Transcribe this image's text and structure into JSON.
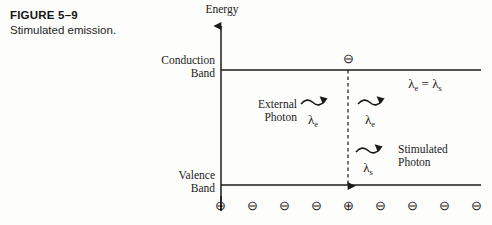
{
  "figure": {
    "number": "FIGURE 5–9",
    "title": "Stimulated emission."
  },
  "diagram": {
    "axis": {
      "energy_label": "Energy",
      "direction": "up"
    },
    "bands": {
      "conduction_line1": "Conduction",
      "conduction_line2": "Band",
      "valence_line1": "Valence",
      "valence_line2": "Band"
    },
    "annotations": {
      "external_photon_line1": "External",
      "external_photon_line2": "Photon",
      "stimulated_photon_line1": "Stimulated",
      "stimulated_photon_line2": "Photon",
      "equation": "λe = λs",
      "equation_lhs": "λ",
      "equation_lhs_sub": "e",
      "equation_op": "=",
      "equation_rhs": "λ",
      "equation_rhs_sub": "s"
    },
    "wavelengths": {
      "external_symbol": "λ",
      "external_sub": "e",
      "incident_after_symbol": "λ",
      "incident_after_sub": "e",
      "stimulated_symbol": "λ",
      "stimulated_sub": "s"
    },
    "carriers": {
      "electron_glyph": "⊖",
      "hole_glyph": "⊕",
      "conduction_electron": "⊖",
      "valence_row": [
        "⊖",
        "⊖",
        "⊖",
        "⊖",
        "⊕",
        "⊖",
        "⊖",
        "⊖",
        "⊖"
      ],
      "hole_index": 4
    },
    "photon_arrows": [
      {
        "name": "external-photon-arrow",
        "label": "λe"
      },
      {
        "name": "incident-photon-arrow",
        "label": "λe"
      },
      {
        "name": "stimulated-photon-arrow",
        "label": "λs"
      }
    ],
    "recombination_arrow": {
      "style": "dashed",
      "direction": "down"
    }
  },
  "colors": {
    "ink": "#1b1b1b",
    "paper": "#fdfdfc"
  }
}
